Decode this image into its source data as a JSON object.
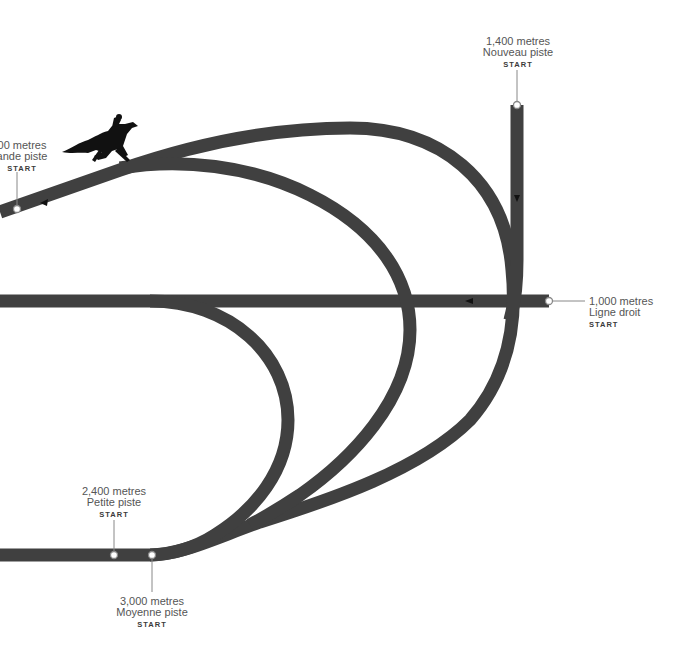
{
  "diagram": {
    "track_color": "#404040",
    "start_markers": [
      {
        "distance": "2,000 metres",
        "visible_distance": "00 metres",
        "track": "Grande piste",
        "visible_track": "ande piste",
        "label": "START"
      },
      {
        "distance": "1,400 metres",
        "track": "Nouveau piste",
        "label": "START"
      },
      {
        "distance": "1,000 metres",
        "track": "Ligne droit",
        "label": "START"
      },
      {
        "distance": "2,400 metres",
        "track": "Petite piste",
        "label": "START"
      },
      {
        "distance": "3,000 metres",
        "track": "Moyenne piste",
        "label": "START"
      }
    ],
    "icons": [
      "horse-and-jockey-icon",
      "direction-arrow-icon"
    ]
  }
}
